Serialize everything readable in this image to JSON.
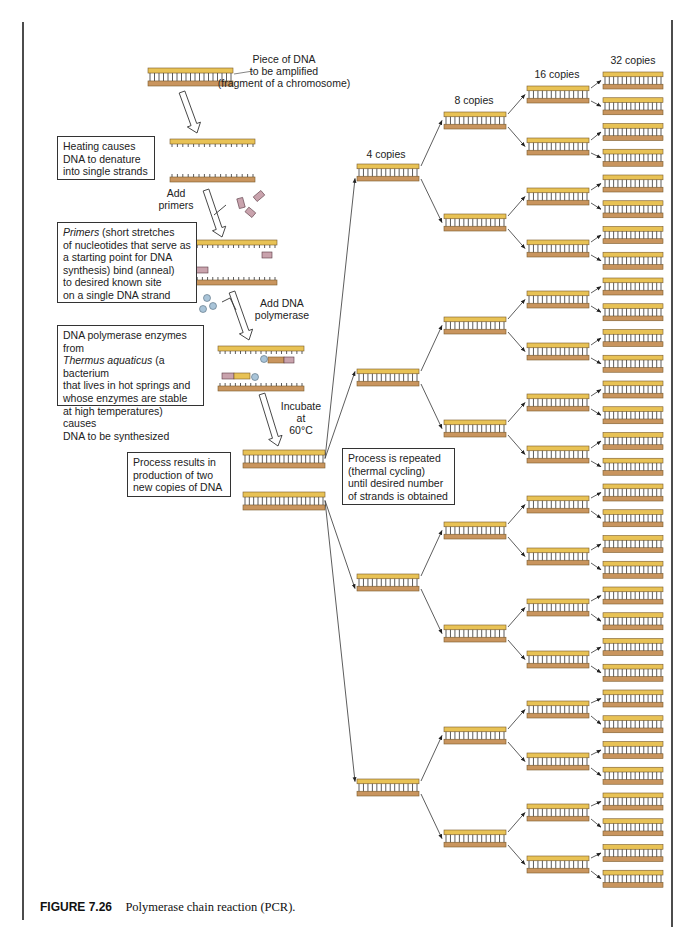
{
  "figure": {
    "number": "FIGURE 7.26",
    "caption": "Polymerase chain reaction (PCR)."
  },
  "labels": {
    "dna_piece": [
      "Piece of DNA",
      "to be amplified",
      "(fragment of a chromosome)"
    ],
    "add_primers": [
      "Add",
      "primers"
    ],
    "add_polymerase": [
      "Add DNA",
      "polymerase"
    ],
    "incubate": [
      "Incubate",
      "at",
      "60°C"
    ],
    "gen4": "4 copies",
    "gen8": "8 copies",
    "gen16": "16 copies",
    "gen32": "32 copies"
  },
  "boxes": {
    "heating": [
      "Heating causes",
      "DNA to denature",
      "into single strands"
    ],
    "primers_prefix": "Primers",
    "primers": [
      " (short stretches",
      "of nucleotides that serve as",
      "a starting point for DNA",
      "synthesis) bind (anneal)",
      "to desired known site",
      "on a single DNA strand"
    ],
    "polymerase_l1": "DNA polymerase enzymes from",
    "polymerase_italic": "Thermus aquaticus",
    "polymerase_l2rest": " (a bacterium",
    "polymerase": [
      "that lives in hot springs and",
      "whose enzymes are stable",
      "at high temperatures) causes",
      "DNA to be synthesized"
    ],
    "results": [
      "Process results in",
      "production of two",
      "new copies of DNA"
    ],
    "repeated": [
      "Process is repeated",
      "(thermal cycling)",
      "until desired number",
      "of strands is obtained"
    ]
  },
  "colors": {
    "strand_top": "#e8c255",
    "strand_bottom": "#c9955e",
    "strand_edge": "#7a5a2a",
    "primer": "#c9a3ad",
    "polymerase": "#a9c4d8",
    "rung": "#333333"
  },
  "tree": {
    "generations": [
      2,
      4,
      8,
      16,
      32
    ]
  }
}
